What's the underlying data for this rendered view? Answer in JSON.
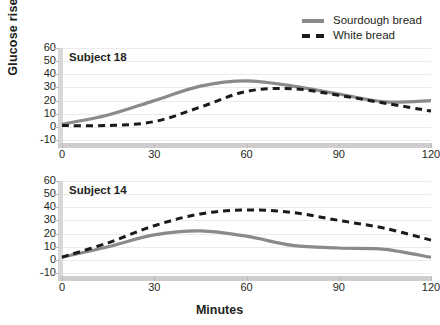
{
  "legend": {
    "items": [
      {
        "label": "Sourdough bread",
        "style": "solid",
        "color": "#8a8a8a",
        "icon": "solid-line-swatch"
      },
      {
        "label": "White bread",
        "style": "dashed",
        "color": "#1a1a1a",
        "icon": "dashed-line-swatch"
      }
    ]
  },
  "axes": {
    "ylabel": "Glucose rise",
    "xlabel": "Minutes",
    "yticks": [
      60,
      50,
      40,
      30,
      20,
      10,
      0,
      -10
    ],
    "xticks": [
      0,
      30,
      60,
      90,
      120
    ]
  },
  "chart_data": [
    {
      "type": "line",
      "title": "Subject 18",
      "xlabel": "Minutes",
      "ylabel": "Glucose rise",
      "xlim": [
        0,
        120
      ],
      "ylim": [
        -10,
        60
      ],
      "grid": true,
      "legend_position": "top-right",
      "x": [
        0,
        15,
        30,
        45,
        60,
        75,
        90,
        105,
        120
      ],
      "series": [
        {
          "name": "Sourdough bread",
          "style": "solid",
          "color": "#8a8a8a",
          "values": [
            2,
            9,
            20,
            31,
            35,
            31,
            25,
            19,
            20
          ]
        },
        {
          "name": "White bread",
          "style": "dashed",
          "color": "#1a1a1a",
          "values": [
            1,
            1,
            4,
            15,
            27,
            29,
            24,
            18,
            12
          ]
        }
      ]
    },
    {
      "type": "line",
      "title": "Subject 14",
      "xlabel": "Minutes",
      "ylabel": "Glucose rise",
      "xlim": [
        0,
        120
      ],
      "ylim": [
        -10,
        60
      ],
      "grid": true,
      "legend_position": "top-right",
      "x": [
        0,
        15,
        30,
        45,
        60,
        75,
        90,
        105,
        120
      ],
      "series": [
        {
          "name": "Sourdough bread",
          "style": "solid",
          "color": "#8a8a8a",
          "values": [
            2,
            10,
            19,
            22,
            18,
            11,
            9,
            8,
            2
          ]
        },
        {
          "name": "White bread",
          "style": "dashed",
          "color": "#1a1a1a",
          "values": [
            2,
            13,
            26,
            35,
            38,
            36,
            30,
            24,
            15
          ]
        }
      ]
    }
  ]
}
